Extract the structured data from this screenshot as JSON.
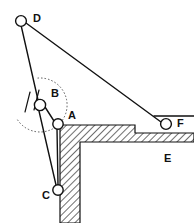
{
  "figure": {
    "background_color": "#ffffff",
    "line_color": "#111111",
    "hatch_color": "#555555",
    "width": 194,
    "height": 223,
    "labels": {
      "a": "A",
      "b": "B",
      "c": "C",
      "d": "D",
      "e": "E",
      "f": "F"
    },
    "joints": [
      {
        "id": "A",
        "label": "A",
        "cx": 58,
        "cy": 124,
        "r": 5.2,
        "label_x": 68,
        "label_y": 116
      },
      {
        "id": "B",
        "label": "B",
        "cx": 40,
        "cy": 105,
        "r": 5.6,
        "label_x": 51,
        "label_y": 94
      },
      {
        "id": "C",
        "label": "C",
        "cx": 58,
        "cy": 190,
        "r": 5.2,
        "label_x": 44,
        "label_y": 196
      },
      {
        "id": "D",
        "label": "D",
        "cx": 21,
        "cy": 21,
        "r": 5.4,
        "label_x": 33,
        "label_y": 19
      },
      {
        "id": "F",
        "label": "F",
        "cx": 166,
        "cy": 124,
        "r": 5.4,
        "label_x": 177,
        "label_y": 124
      }
    ],
    "ground_label": {
      "id": "E",
      "label": "E",
      "x": 164,
      "y": 159
    },
    "members": [
      {
        "name": "member-d-b",
        "x1": 21,
        "x2": 38,
        "y1": 25,
        "y2": 100
      },
      {
        "name": "member-b-a",
        "x1": 45,
        "x2": 54,
        "y1": 107,
        "y2": 121
      },
      {
        "name": "member-b-c",
        "x1": 39,
        "x2": 56,
        "y1": 111,
        "y2": 185
      },
      {
        "name": "member-a-c",
        "x1": 57,
        "x2": 58,
        "y1": 129,
        "y2": 185
      }
    ],
    "cable": {
      "name": "cable-d-f",
      "x1": 26,
      "y1": 23,
      "x2": 161,
      "y2": 122
    },
    "ground_outline": "M 60,125 L 135,125 L 135,133 L 194,133 L 194,142 L 80,142 L 80,223 L 60,223 Z",
    "support_ticks": [
      {
        "x1": 30,
        "y1": 92,
        "x2": 25,
        "y2": 112
      },
      {
        "x1": 39,
        "y1": 90,
        "x2": 34,
        "y2": 110
      }
    ],
    "angle_arc": {
      "cx": 40,
      "cy": 105,
      "r": 27,
      "start_deg": 95,
      "end_deg": 330
    },
    "pulley_rope": {
      "x1": 154,
      "y1": 116,
      "x2": 194,
      "y2": 116
    }
  }
}
